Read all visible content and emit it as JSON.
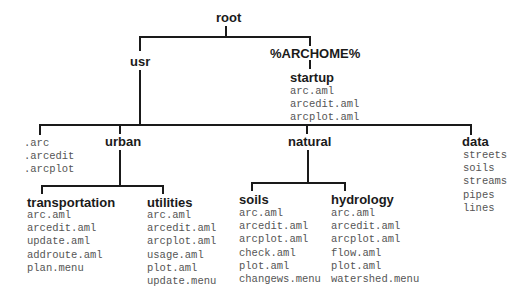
{
  "diagram": {
    "type": "directory-tree",
    "nodes": {
      "root": "root",
      "usr": "usr",
      "archome": "%ARCHOME%",
      "startup": {
        "label": "startup",
        "files": [
          "arc.aml",
          "arcedit.aml",
          "arcplot.aml"
        ]
      },
      "usr_files": [
        ".arc",
        ".arcedit",
        ".arcplot"
      ],
      "urban": "urban",
      "natural": "natural",
      "data": {
        "label": "data",
        "files": [
          "streets",
          "soils",
          "streams",
          "pipes",
          "lines"
        ]
      },
      "transportation": {
        "label": "transportation",
        "files": [
          "arc.aml",
          "arcedit.aml",
          "update.aml",
          "addroute.aml",
          "plan.menu"
        ]
      },
      "utilities": {
        "label": "utilities",
        "files": [
          "arc.aml",
          "arcedit.aml",
          "arcplot.aml",
          "usage.aml",
          "plot.aml",
          "update.menu"
        ]
      },
      "soils": {
        "label": "soils",
        "files": [
          "arc.aml",
          "arcedit.aml",
          "arcplot.aml",
          "check.aml",
          "plot.aml",
          "changews.menu"
        ]
      },
      "hydrology": {
        "label": "hydrology",
        "files": [
          "arc.aml",
          "arcedit.aml",
          "arcplot.aml",
          "flow.aml",
          "plot.aml",
          "watershed.menu"
        ]
      }
    },
    "edges": [
      [
        "root",
        "usr"
      ],
      [
        "root",
        "%ARCHOME%"
      ],
      [
        "%ARCHOME%",
        "startup"
      ],
      [
        "usr",
        ".arc files"
      ],
      [
        "usr",
        "urban"
      ],
      [
        "usr",
        "natural"
      ],
      [
        "usr",
        "data"
      ],
      [
        "urban",
        "transportation"
      ],
      [
        "urban",
        "utilities"
      ],
      [
        "natural",
        "soils"
      ],
      [
        "natural",
        "hydrology"
      ]
    ]
  }
}
